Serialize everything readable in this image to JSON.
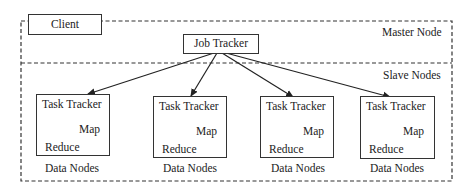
{
  "diagram": {
    "type": "hadoop-architecture",
    "client": {
      "label": "Client"
    },
    "regions": {
      "master": {
        "label": "Master Node"
      },
      "slave": {
        "label": "Slave Nodes"
      }
    },
    "job_tracker": {
      "label": "Job Tracker"
    },
    "task_trackers": [
      {
        "title": "Task Tracker",
        "map": "Map",
        "reduce": "Reduce",
        "caption": "Data Nodes"
      },
      {
        "title": "Task Tracker",
        "map": "Map",
        "reduce": "Reduce",
        "caption": "Data Nodes"
      },
      {
        "title": "Task Tracker",
        "map": "Map",
        "reduce": "Reduce",
        "caption": "Data Nodes"
      },
      {
        "title": "Task Tracker",
        "map": "Map",
        "reduce": "Reduce",
        "caption": "Data Nodes"
      }
    ],
    "edges": [
      {
        "from": "Job Tracker",
        "to": "Task Tracker 1"
      },
      {
        "from": "Job Tracker",
        "to": "Task Tracker 2"
      },
      {
        "from": "Job Tracker",
        "to": "Task Tracker 3"
      },
      {
        "from": "Job Tracker",
        "to": "Task Tracker 4"
      },
      {
        "from": "Task Tracker",
        "to": "Map"
      },
      {
        "from": "Task Tracker",
        "to": "Reduce"
      }
    ],
    "colors": {
      "stroke": "#333333",
      "background": "#ffffff"
    }
  }
}
